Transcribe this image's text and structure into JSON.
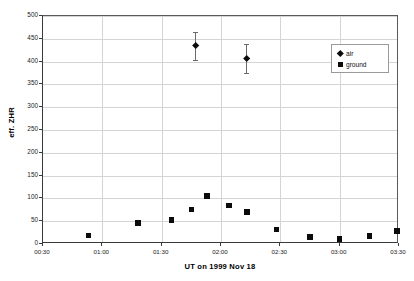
{
  "chart_data": {
    "type": "scatter",
    "title": "",
    "xlabel": "UT on 1999 Nov 18",
    "ylabel": "eff. ZHR",
    "xlim": [
      "00:30",
      "03:30"
    ],
    "ylim": [
      0,
      500
    ],
    "xticks": [
      "00:30",
      "01:00",
      "01:30",
      "02:00",
      "02:30",
      "03:00",
      "03:30"
    ],
    "yticks": [
      0,
      50,
      100,
      150,
      200,
      250,
      300,
      350,
      400,
      450,
      500
    ],
    "grid": true,
    "legend_position": "upper right",
    "legend": [
      "air",
      "ground"
    ],
    "series": [
      {
        "name": "air",
        "marker": "diamond",
        "color": "#0b0b0b",
        "has_error_bars": true,
        "points": [
          {
            "x": "01:47",
            "y": 434,
            "yerr": 31
          },
          {
            "x": "02:13",
            "y": 407,
            "yerr": 31
          }
        ]
      },
      {
        "name": "ground",
        "marker": "square",
        "color": "#0b0b0b",
        "has_error_bars": false,
        "points": [
          {
            "x": "00:53",
            "y": 19
          },
          {
            "x": "01:18",
            "y": 46
          },
          {
            "x": "01:35",
            "y": 53
          },
          {
            "x": "01:45",
            "y": 76
          },
          {
            "x": "01:53",
            "y": 105
          },
          {
            "x": "02:04",
            "y": 84
          },
          {
            "x": "02:13",
            "y": 70
          },
          {
            "x": "02:28",
            "y": 32
          },
          {
            "x": "02:45",
            "y": 15
          },
          {
            "x": "03:00",
            "y": 11
          },
          {
            "x": "03:15",
            "y": 17
          },
          {
            "x": "03:29",
            "y": 28
          }
        ]
      }
    ]
  },
  "axes": {
    "y_title": "eff. ZHR",
    "x_title": "UT on 1999 Nov 18"
  },
  "legend": {
    "items": [
      {
        "label": "air",
        "marker": "diamond-marker-icon"
      },
      {
        "label": "ground",
        "marker": "square-marker-icon"
      }
    ]
  }
}
